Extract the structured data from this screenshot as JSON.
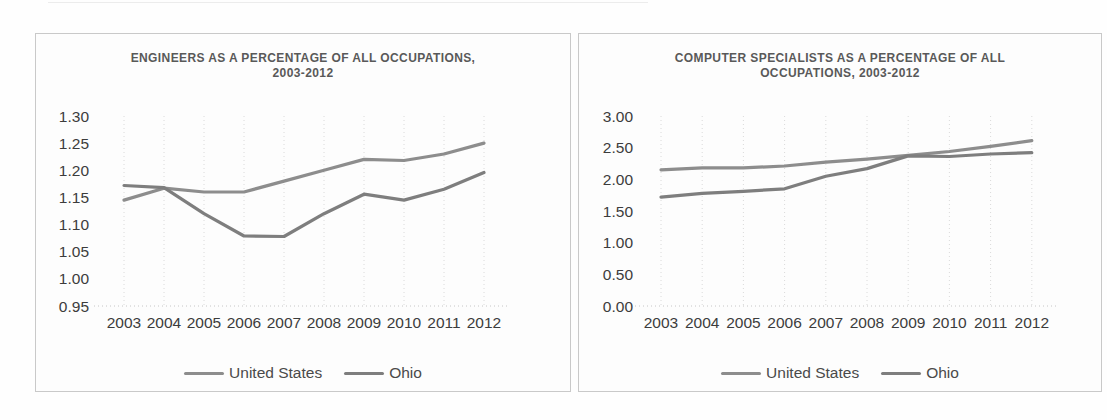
{
  "page": {
    "background_color": "#fefefe",
    "panel_border_color": "#c9c9c9",
    "title_color": "#595959",
    "tick_color": "#3c3c3c",
    "gridline_color": "#dadada"
  },
  "chart_data": [
    {
      "type": "line",
      "title": "ENGINEERS AS A PERCENTAGE OF ALL OCCUPATIONS, 2003-2012",
      "title_lines": [
        "ENGINEERS AS A PERCENTAGE OF ALL OCCUPATIONS,",
        "2003-2012"
      ],
      "categories": [
        "2003",
        "2004",
        "2005",
        "2006",
        "2007",
        "2008",
        "2009",
        "2010",
        "2011",
        "2012"
      ],
      "series": [
        {
          "name": "United States",
          "color": "#8d8d8d",
          "values": [
            1.145,
            1.167,
            1.16,
            1.16,
            1.18,
            1.2,
            1.22,
            1.218,
            1.23,
            1.25
          ]
        },
        {
          "name": "Ohio",
          "color": "#7e7e7e",
          "values": [
            1.172,
            1.168,
            1.12,
            1.079,
            1.078,
            1.12,
            1.156,
            1.145,
            1.165,
            1.196
          ]
        }
      ],
      "ylim": [
        0.95,
        1.3
      ],
      "ytick_step": 0.05,
      "y_tick_labels": [
        "1.30",
        "1.25",
        "1.20",
        "1.15",
        "1.10",
        "1.05",
        "1.00",
        "0.95"
      ],
      "xlabel": "",
      "ylabel": "",
      "grid": "vertical-dotted",
      "legend_position": "bottom"
    },
    {
      "type": "line",
      "title": "COMPUTER SPECIALISTS AS A PERCENTAGE OF ALL OCCUPATIONS, 2003-2012",
      "title_lines": [
        "COMPUTER SPECIALISTS AS A PERCENTAGE OF ALL",
        "OCCUPATIONS, 2003-2012"
      ],
      "categories": [
        "2003",
        "2004",
        "2005",
        "2006",
        "2007",
        "2008",
        "2009",
        "2010",
        "2011",
        "2012"
      ],
      "series": [
        {
          "name": "United States",
          "color": "#8d8d8d",
          "values": [
            2.15,
            2.18,
            2.18,
            2.21,
            2.27,
            2.32,
            2.38,
            2.44,
            2.52,
            2.61
          ]
        },
        {
          "name": "Ohio",
          "color": "#7e7e7e",
          "values": [
            1.72,
            1.78,
            1.81,
            1.85,
            2.05,
            2.17,
            2.37,
            2.36,
            2.4,
            2.42
          ]
        }
      ],
      "ylim": [
        0.0,
        3.0
      ],
      "ytick_step": 0.5,
      "y_tick_labels": [
        "3.00",
        "2.50",
        "2.00",
        "1.50",
        "1.00",
        "0.50",
        "0.00"
      ],
      "xlabel": "",
      "ylabel": "",
      "grid": "vertical-dotted",
      "legend_position": "bottom"
    }
  ]
}
